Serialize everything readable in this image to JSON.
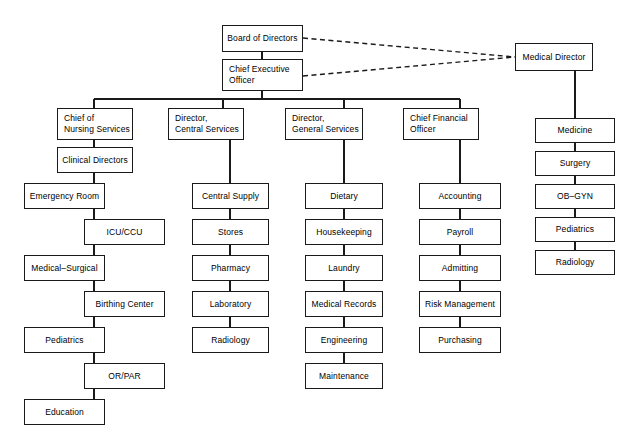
{
  "diagram": {
    "background_color": "#ffffff",
    "line_color": "#1a1a1a",
    "nodes": {
      "board_of_directors": "Board of Directors",
      "chief_executive_officer": "Chief Executive\nOfficer",
      "medical_director": "Medical Director",
      "chief_of_nursing_services": "Chief of\nNursing Services",
      "director_central_services": "Director,\nCentral Services",
      "director_general_services": "Director,\nGeneral Services",
      "chief_financial_officer": "Chief Financial\nOfficer"
    },
    "nursing_branch": {
      "clinical_directors": "Clinical Directors",
      "emergency_room": "Emergency Room",
      "icu_ccu": "ICU/CCU",
      "medical_surgical": "Medical–Surgical",
      "birthing_center": "Birthing Center",
      "pediatrics": "Pediatrics",
      "or_par": "OR/PAR",
      "education": "Education"
    },
    "central_services_branch": {
      "central_supply": "Central Supply",
      "stores": "Stores",
      "pharmacy": "Pharmacy",
      "laboratory": "Laboratory",
      "radiology": "Radiology"
    },
    "general_services_branch": {
      "dietary": "Dietary",
      "housekeeping": "Housekeeping",
      "laundry": "Laundry",
      "medical_records": "Medical Records",
      "engineering": "Engineering",
      "maintenance": "Maintenance"
    },
    "financial_branch": {
      "accounting": "Accounting",
      "payroll": "Payroll",
      "admitting": "Admitting",
      "risk_management": "Risk Management",
      "purchasing": "Purchasing"
    },
    "medical_branch": {
      "medicine": "Medicine",
      "surgery": "Surgery",
      "ob_gyn": "OB–GYN",
      "pediatrics": "Pediatrics",
      "radiology": "Radiology"
    }
  }
}
